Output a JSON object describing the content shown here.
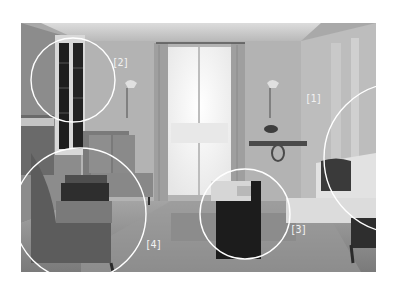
{
  "image": {
    "description": "Black-and-white photo of a classic living room with tufted sofas, armchairs, a coffee table, tall French window with curtains, wall sconces and a console table, annotated with four circled callouts",
    "palette": {
      "ceiling": "#cfcfcf",
      "wall": "#a8a8a8",
      "window_light": "#f4f4f4",
      "floor": "#8e8e8e",
      "dark_furniture": "#2a2a2a",
      "annotation": "#ffffff"
    }
  },
  "callouts": [
    {
      "id": "1",
      "label": "[1]",
      "subject": "tufted sofa on the right"
    },
    {
      "id": "2",
      "label": "[2]",
      "subject": "built-in bookshelf"
    },
    {
      "id": "3",
      "label": "[3]",
      "subject": "coffee table"
    },
    {
      "id": "4",
      "label": "[4]",
      "subject": "armchairs and sofa on the left"
    }
  ]
}
